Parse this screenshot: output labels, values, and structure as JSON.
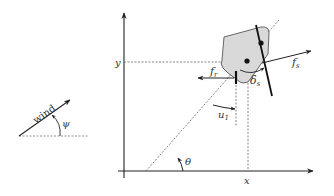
{
  "diagram": {
    "type": "sailboat-kinematics",
    "colors": {
      "line": "#222222",
      "dashed": "#777777",
      "hull_fill": "#d9d9d9",
      "hull_stroke": "#333333",
      "text": "#333333"
    },
    "axes": {
      "x_label": "x",
      "y_label": "y"
    },
    "wind": {
      "label": "wind",
      "angle_label": "ψ"
    },
    "boat": {
      "heading_angle_label": "θ",
      "rudder_angle_label": "u",
      "rudder_angle_subscript": "1",
      "sail_angle_label": "δ",
      "sail_angle_subscript": "s",
      "rudder_force_label": "f",
      "rudder_force_subscript": "r",
      "sail_force_label": "f",
      "sail_force_subscript": "s"
    }
  }
}
